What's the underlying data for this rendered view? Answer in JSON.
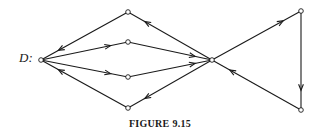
{
  "figure": {
    "graph_label": "D:",
    "caption": "FIGURE 9.15"
  },
  "graph": {
    "stroke_color": "#1a1a1a",
    "node_fill": "#ffffff",
    "nodes": [
      {
        "id": "d",
        "x": 41,
        "y": 60
      },
      {
        "id": "top",
        "x": 128,
        "y": 12
      },
      {
        "id": "upper-mid",
        "x": 128,
        "y": 42
      },
      {
        "id": "lower-mid",
        "x": 128,
        "y": 77
      },
      {
        "id": "bottom",
        "x": 128,
        "y": 108
      },
      {
        "id": "center",
        "x": 212,
        "y": 60
      },
      {
        "id": "top-right",
        "x": 301,
        "y": 11
      },
      {
        "id": "bottom-right",
        "x": 301,
        "y": 110
      }
    ],
    "edges": [
      {
        "from": "top",
        "to": "d"
      },
      {
        "from": "d",
        "to": "upper-mid"
      },
      {
        "from": "d",
        "to": "lower-mid"
      },
      {
        "from": "bottom",
        "to": "d"
      },
      {
        "from": "center",
        "to": "top"
      },
      {
        "from": "upper-mid",
        "to": "center"
      },
      {
        "from": "lower-mid",
        "to": "center"
      },
      {
        "from": "center",
        "to": "bottom"
      },
      {
        "from": "center",
        "to": "top-right"
      },
      {
        "from": "top-right",
        "to": "bottom-right"
      },
      {
        "from": "bottom-right",
        "to": "center"
      }
    ]
  }
}
